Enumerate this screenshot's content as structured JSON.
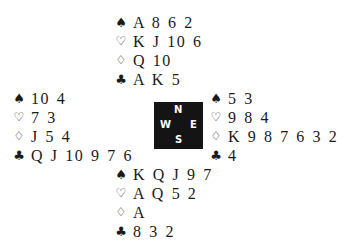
{
  "suit_symbols": {
    "spades": "♠",
    "hearts": "♡",
    "diamonds": "♢",
    "clubs": "♣"
  },
  "compass": {
    "north": "N",
    "west": "W",
    "east": "E",
    "south": "S"
  },
  "hands": {
    "north": {
      "spades": "A 8 6 2",
      "hearts": "K J 10 6",
      "diamonds": "Q 10",
      "clubs": "A K 5"
    },
    "west": {
      "spades": "10 4",
      "hearts": "7 3",
      "diamonds": "J 5 4",
      "clubs": "Q J 10 9 7 6"
    },
    "east": {
      "spades": "5 3",
      "hearts": "9 8 4",
      "diamonds": "K 9 8 7 6 3 2",
      "clubs": "4"
    },
    "south": {
      "spades": "K Q J 9 7",
      "hearts": "A Q 5 2",
      "diamonds": "A",
      "clubs": "8 3 2"
    }
  }
}
